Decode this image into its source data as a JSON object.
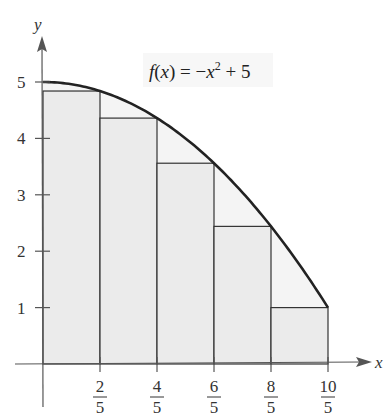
{
  "chart_data": {
    "type": "area",
    "title": "",
    "function_label": "f(x) = −x² + 5",
    "xlabel": "x",
    "ylabel": "y",
    "xlim": [
      0,
      2
    ],
    "ylim": [
      0,
      5
    ],
    "x_ticks": [
      {
        "value": 0.4,
        "num": "2",
        "den": "5"
      },
      {
        "value": 0.8,
        "num": "4",
        "den": "5"
      },
      {
        "value": 1.2,
        "num": "6",
        "den": "5"
      },
      {
        "value": 1.6,
        "num": "8",
        "den": "5"
      },
      {
        "value": 2.0,
        "num": "10",
        "den": "5"
      }
    ],
    "y_ticks": [
      1,
      2,
      3,
      4,
      5
    ],
    "curve": {
      "expression": "-x^2 + 5",
      "x": [
        0,
        0.4,
        0.8,
        1.2,
        1.6,
        2.0
      ],
      "y": [
        5,
        4.84,
        4.36,
        3.56,
        2.44,
        1
      ]
    },
    "rectangles": [
      {
        "x0": 0,
        "x1": 0.4,
        "height": 4.84
      },
      {
        "x0": 0.4,
        "x1": 0.8,
        "height": 4.36
      },
      {
        "x0": 0.8,
        "x1": 1.2,
        "height": 3.56
      },
      {
        "x0": 1.2,
        "x1": 1.6,
        "height": 2.44
      },
      {
        "x0": 1.6,
        "x1": 2.0,
        "height": 1
      }
    ],
    "grid": false,
    "legend": "none"
  },
  "labels": {
    "x_axis": "x",
    "y_axis": "y",
    "equation": "f(x) = −x² + 5",
    "y_tick_labels": [
      "1",
      "2",
      "3",
      "4",
      "5"
    ],
    "x_tick_nums": [
      "2",
      "4",
      "6",
      "8",
      "10"
    ],
    "x_tick_dens": [
      "5",
      "5",
      "5",
      "5",
      "5"
    ]
  },
  "colors": {
    "rect_fill": "#ebebeb",
    "area_fill": "#f4f4f4",
    "line": "#222222"
  }
}
